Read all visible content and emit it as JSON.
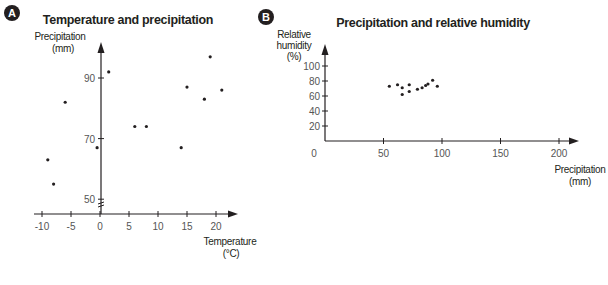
{
  "panels": [
    {
      "badge": "A",
      "title": "Temperature and precipitation"
    },
    {
      "badge": "B",
      "title": "Precipitation and relative humidity"
    }
  ],
  "colors": {
    "ink": "#231f20",
    "tick_text": "#555555",
    "badge_fill": "#231f20",
    "point": "#231f20"
  },
  "chart_data": [
    {
      "type": "scatter",
      "panel": "A",
      "title": "Temperature and precipitation",
      "xlabel": "Temperature (°C)",
      "ylabel": "Precipitation (mm)",
      "xlabel_lines": [
        "Temperature",
        "(°C)"
      ],
      "ylabel_lines": [
        "Precipitation",
        "(mm)"
      ],
      "x_ticks": [
        -10,
        -5,
        0,
        5,
        10,
        15,
        20
      ],
      "y_ticks": [
        50,
        70,
        90
      ],
      "xlim": [
        -11,
        23
      ],
      "ylim": [
        45,
        100
      ],
      "y_axis_break": true,
      "grid": false,
      "legend": null,
      "points": [
        {
          "x": -9,
          "y": 63
        },
        {
          "x": -8,
          "y": 55
        },
        {
          "x": -6,
          "y": 82
        },
        {
          "x": -0.5,
          "y": 67
        },
        {
          "x": 1.5,
          "y": 92
        },
        {
          "x": 6,
          "y": 74
        },
        {
          "x": 8,
          "y": 74
        },
        {
          "x": 14,
          "y": 67
        },
        {
          "x": 15,
          "y": 87
        },
        {
          "x": 18,
          "y": 83
        },
        {
          "x": 19,
          "y": 97
        },
        {
          "x": 21,
          "y": 86
        }
      ]
    },
    {
      "type": "scatter",
      "panel": "B",
      "title": "Precipitation and relative humidity",
      "xlabel": "Precipitation (mm)",
      "ylabel": "Relative humidity (%)",
      "xlabel_lines": [
        "Precipitation",
        "(mm)"
      ],
      "ylabel_lines": [
        "Relative",
        "humidity",
        "(%)"
      ],
      "x_ticks": [
        0,
        50,
        100,
        150,
        200
      ],
      "y_ticks": [
        20,
        40,
        60,
        80,
        100
      ],
      "xlim": [
        0,
        215
      ],
      "ylim": [
        0,
        130
      ],
      "grid": false,
      "legend": null,
      "points": [
        {
          "x": 55,
          "y": 73
        },
        {
          "x": 62,
          "y": 75
        },
        {
          "x": 66,
          "y": 71
        },
        {
          "x": 66,
          "y": 62
        },
        {
          "x": 72,
          "y": 75
        },
        {
          "x": 72,
          "y": 66
        },
        {
          "x": 79,
          "y": 69
        },
        {
          "x": 83,
          "y": 71
        },
        {
          "x": 86,
          "y": 74
        },
        {
          "x": 88,
          "y": 76
        },
        {
          "x": 92,
          "y": 81
        },
        {
          "x": 96,
          "y": 73
        }
      ]
    }
  ]
}
